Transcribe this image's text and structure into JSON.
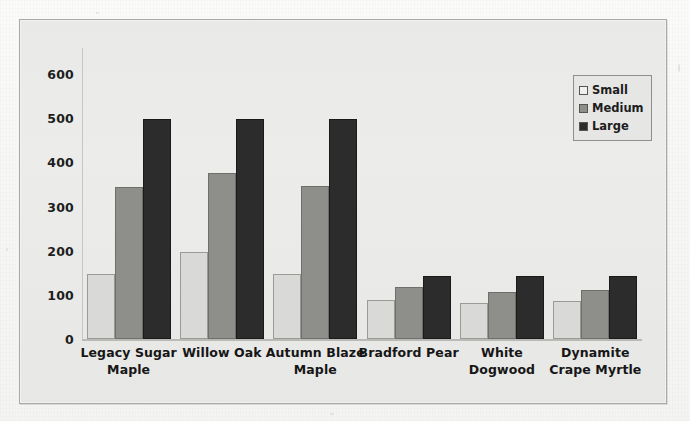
{
  "chart_data": {
    "type": "bar",
    "title": "",
    "subtitle": "",
    "xlabel": "",
    "ylabel": "",
    "categories": [
      "Legacy Sugar Maple",
      "Willow Oak",
      "Autumn Blaze Maple",
      "Bradford Pear",
      "White Dogwood",
      "Dynamite Crape Myrtle"
    ],
    "series": [
      {
        "name": "Small",
        "color": "#d9d9d7",
        "values": [
          147,
          196,
          147,
          89,
          81,
          85
        ]
      },
      {
        "name": "Medium",
        "color": "#8e8e8b",
        "values": [
          345,
          376,
          347,
          118,
          107,
          111
        ]
      },
      {
        "name": "Large",
        "color": "#2c2c2c",
        "values": [
          498,
          498,
          498,
          143,
          143,
          143
        ]
      }
    ],
    "ylim": [
      0,
      640
    ],
    "yticks": [
      0,
      100,
      200,
      300,
      400,
      500,
      600
    ],
    "ytick_labels": [
      "0",
      "100",
      "200",
      "300",
      "400",
      "500",
      "600"
    ],
    "grid": false,
    "legend_position": "top-right",
    "legend_entries": [
      "Small",
      "Medium",
      "Large"
    ]
  },
  "legend": {
    "items": [
      {
        "label": "Small",
        "swatch": "legend-swatch-small"
      },
      {
        "label": "Medium",
        "swatch": "legend-swatch-medium"
      },
      {
        "label": "Large",
        "swatch": "legend-swatch-large"
      }
    ]
  },
  "colors": {
    "small": "#d9d9d7",
    "medium": "#8e8e8b",
    "large": "#2c2c2c",
    "plot_background": "#eaeae8",
    "frame_border": "#a9a9a6",
    "axis": "#b9b9b6",
    "text": "#161616"
  }
}
